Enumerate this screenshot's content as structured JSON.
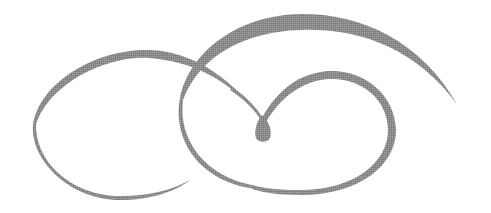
{
  "graphic": {
    "type": "decorative-swirl-flourish",
    "stroke_color": "#8a8a8a",
    "background_color": "#ffffff",
    "width": 491,
    "height": 213
  }
}
